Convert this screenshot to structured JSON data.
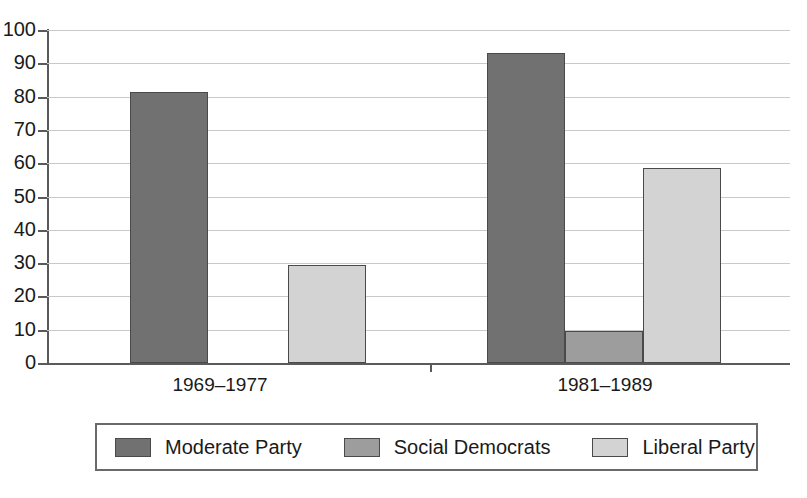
{
  "chart_data": {
    "type": "bar",
    "title": "",
    "subtitle": "",
    "xlabel": "",
    "ylabel": "",
    "ylim": [
      0,
      100
    ],
    "ytick_step": 10,
    "yticks": [
      "100",
      "90",
      "80",
      "70",
      "60",
      "50",
      "40",
      "30",
      "20",
      "10",
      "0"
    ],
    "grid": true,
    "legend_position": "bottom",
    "categories": [
      "1969–1977",
      "1981–1989"
    ],
    "series": [
      {
        "name": "Moderate Party",
        "color": "#717171",
        "values": [
          81.5,
          93.0
        ]
      },
      {
        "name": "Social Democrats",
        "color": "#9d9d9d",
        "values": [
          0,
          9.5
        ]
      },
      {
        "name": "Liberal Party",
        "color": "#d3d3d3",
        "values": [
          29.5,
          58.5
        ]
      }
    ]
  },
  "legend": {
    "items": [
      {
        "label": "Moderate Party",
        "swatch": "legend-swatch-moderate-party"
      },
      {
        "label": "Social Democrats",
        "swatch": "legend-swatch-social-democrats"
      },
      {
        "label": "Liberal Party",
        "swatch": "legend-swatch-liberal-party"
      }
    ]
  },
  "axes": {
    "y_axis_name": "y-axis",
    "x_axis_name": "x-axis"
  }
}
